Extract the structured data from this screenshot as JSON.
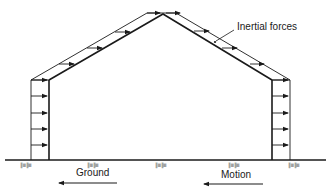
{
  "diagram": {
    "labels": {
      "inertial_forces": "Inertial forces",
      "ground": "Ground",
      "motion": "Motion"
    },
    "ground_hatch_marks": [
      "∥≡∥≡",
      "∥≡∥≡",
      "∥≡∥≡",
      "∥≡∥≡",
      "∥≡∥≡"
    ],
    "colors": {
      "line": "#1a1a1a",
      "background": "#ffffff"
    },
    "force_arrows": {
      "left_wall_count": 5,
      "right_wall_count": 5,
      "left_roof_count": 4,
      "right_roof_count": 4,
      "direction": "right"
    },
    "ground_direction": "left",
    "motion_direction": "left"
  }
}
